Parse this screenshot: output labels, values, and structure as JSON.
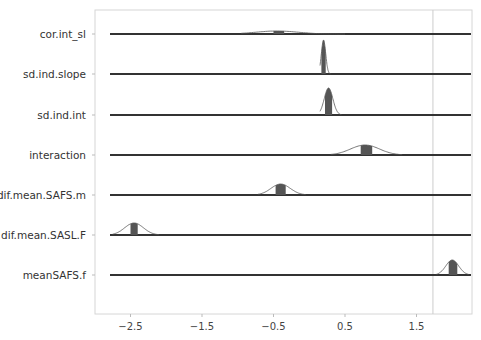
{
  "chart_data": {
    "type": "ridgeline",
    "title": "",
    "xlabel": "",
    "ylabel": "",
    "xlim": [
      -2.99,
      2.29
    ],
    "x_ticks": [
      -2.5,
      -1.5,
      -0.5,
      0.5,
      1.5
    ],
    "x_tick_labels": [
      "−2.5",
      "−1.5",
      "−0.5",
      "0.5",
      "1.5"
    ],
    "reference_line_x": 1.73,
    "grid": false,
    "legend": null,
    "categories": [
      "cor.int_sl",
      "sd.ind.slope",
      "sd.ind.int",
      "interaction",
      "dif.mean.SAFS.m",
      "dif.mean.SASL.F",
      "meanSAFS.f"
    ],
    "series": [
      {
        "name": "cor.int_sl",
        "mean": -0.45,
        "interval": [
          -0.5,
          -0.35
        ],
        "range": [
          -0.95,
          0.5
        ],
        "peak_height": 3
      },
      {
        "name": "sd.ind.slope",
        "mean": 0.2,
        "interval": [
          0.17,
          0.23
        ],
        "range": [
          0.15,
          0.3
        ],
        "peak_height": 34
      },
      {
        "name": "sd.ind.int",
        "mean": 0.27,
        "interval": [
          0.22,
          0.32
        ],
        "range": [
          0.15,
          0.45
        ],
        "peak_height": 27
      },
      {
        "name": "interaction",
        "mean": 0.78,
        "interval": [
          0.72,
          0.88
        ],
        "range": [
          0.3,
          1.3
        ],
        "peak_height": 10
      },
      {
        "name": "dif.mean.SAFS.m",
        "mean": -0.4,
        "interval": [
          -0.47,
          -0.33
        ],
        "range": [
          -0.72,
          -0.05
        ],
        "peak_height": 11
      },
      {
        "name": "dif.mean.SASL.F",
        "mean": -2.45,
        "interval": [
          -2.5,
          -2.4
        ],
        "range": [
          -2.75,
          -2.1
        ],
        "peak_height": 12
      },
      {
        "name": "meanSAFS.f",
        "mean": 2.0,
        "interval": [
          1.95,
          2.07
        ],
        "range": [
          1.78,
          2.23
        ],
        "peak_height": 15
      }
    ]
  },
  "colors": {
    "baseline": "#333333",
    "interval_fill": "#555555",
    "density_fill": "#666666",
    "density_line": "#555555",
    "axis_border": "#d0d0d0",
    "ref_line": "#cccccc"
  }
}
